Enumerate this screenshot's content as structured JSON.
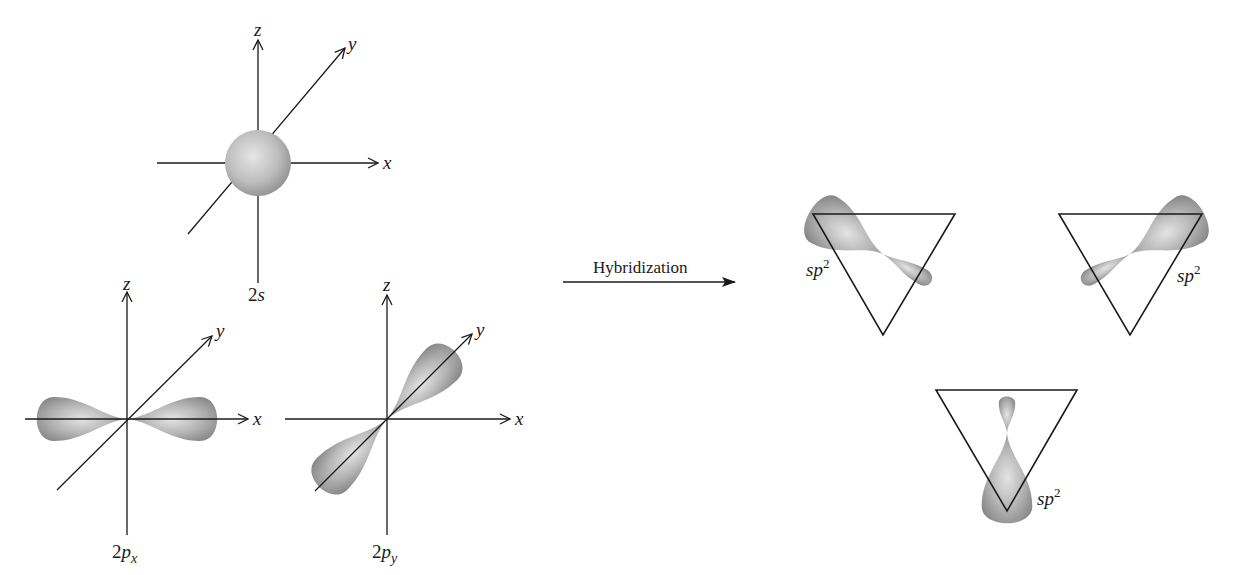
{
  "figure": {
    "colors": {
      "line": "#1a1a1a",
      "lobe_dark": "#8a8a8a",
      "lobe_light": "#e2e2e2",
      "background": "#ffffff"
    },
    "orbitals": [
      {
        "id": "2s",
        "label_main": "2",
        "label_italic": "s",
        "label_sub": "",
        "axes": {
          "x": "x",
          "y": "y",
          "z": "z"
        },
        "shape": "sphere"
      },
      {
        "id": "2px",
        "label_main": "2",
        "label_italic": "p",
        "label_sub": "x",
        "axes": {
          "x": "x",
          "y": "y",
          "z": "z"
        },
        "shape": "dumbbell-along-x"
      },
      {
        "id": "2py",
        "label_main": "2",
        "label_italic": "p",
        "label_sub": "y",
        "axes": {
          "x": "x",
          "y": "y",
          "z": "z"
        },
        "shape": "dumbbell-along-y"
      }
    ],
    "process_arrow": {
      "label": "Hybridization"
    },
    "hybrids": [
      {
        "id": "sp2-a",
        "label_italic": "sp",
        "label_sup": "2",
        "orientation": "upper-left"
      },
      {
        "id": "sp2-b",
        "label_italic": "sp",
        "label_sup": "2",
        "orientation": "upper-right"
      },
      {
        "id": "sp2-c",
        "label_italic": "sp",
        "label_sup": "2",
        "orientation": "down"
      }
    ]
  }
}
